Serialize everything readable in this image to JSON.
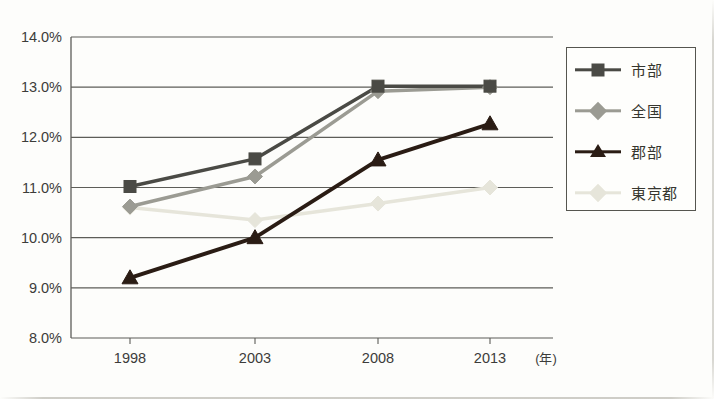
{
  "chart_data": {
    "type": "line",
    "title": "",
    "xlabel": "(年)",
    "ylabel": "",
    "categories": [
      "1998",
      "2003",
      "2008",
      "2013"
    ],
    "x_unit_label": "(年)",
    "ylim": [
      8.0,
      14.0
    ],
    "y_ticks": [
      "8.0%",
      "9.0%",
      "10.0%",
      "11.0%",
      "12.0%",
      "13.0%",
      "14.0%"
    ],
    "y_tick_values": [
      8.0,
      9.0,
      10.0,
      11.0,
      12.0,
      13.0,
      14.0
    ],
    "grid": true,
    "legend_position": "right",
    "series": [
      {
        "name": "市部",
        "marker": "square",
        "color": "#4a4a45",
        "values": [
          11.02,
          11.57,
          13.02,
          13.02
        ]
      },
      {
        "name": "全国",
        "marker": "diamond",
        "color": "#9b9b93",
        "values": [
          10.62,
          11.22,
          12.92,
          13.0
        ]
      },
      {
        "name": "郡部",
        "marker": "triangle",
        "color": "#2a1c14",
        "values": [
          9.2,
          10.0,
          11.55,
          12.27
        ]
      },
      {
        "name": "東京都",
        "marker": "diamond",
        "color": "#e6e5da",
        "values": [
          10.6,
          10.35,
          10.68,
          11.0
        ]
      }
    ]
  },
  "legend": {
    "items": [
      {
        "label": "市部",
        "marker": "square",
        "color": "#4a4a45"
      },
      {
        "label": "全国",
        "marker": "diamond",
        "color": "#9b9b93"
      },
      {
        "label": "郡部",
        "marker": "triangle",
        "color": "#2a1c14"
      },
      {
        "label": "東京都",
        "marker": "diamond",
        "color": "#e6e5da"
      }
    ]
  },
  "axis": {
    "x_labels": [
      "1998",
      "2003",
      "2008",
      "2013"
    ],
    "x_unit": "(年)",
    "y_labels": [
      "14.0%",
      "13.0%",
      "12.0%",
      "11.0%",
      "10.0%",
      "9.0%",
      "8.0%"
    ]
  },
  "colors": {
    "grid": "#5d5d58",
    "frame": "#5d5d58",
    "background": "#fdfdfb",
    "text": "#3c3c3a"
  }
}
